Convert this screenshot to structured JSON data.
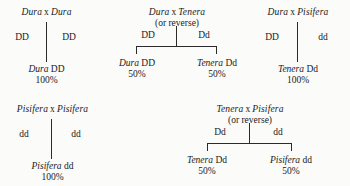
{
  "figure": {
    "type": "genetics-cross-diagram",
    "background_color": "#fbfbfa",
    "line_color": "#2b2b2b",
    "text_color": "#1a1a1a"
  },
  "crosses": [
    {
      "id": "dura-x-dura",
      "title_left": "Dura",
      "title_symbol": "x",
      "title_right": "Dura",
      "subtitle": "",
      "parent_left": "DD",
      "parent_right": "DD",
      "connector": "single",
      "offspring": [
        {
          "name": "Dura",
          "genotype": "DD",
          "percent": "100%"
        }
      ]
    },
    {
      "id": "dura-x-tenera",
      "title_left": "Dura",
      "title_symbol": "x",
      "title_right": "Tenera",
      "subtitle": "(or reverse)",
      "parent_left": "DD",
      "parent_right": "Dd",
      "connector": "fork",
      "offspring": [
        {
          "name": "Dura",
          "genotype": "DD",
          "percent": "50%"
        },
        {
          "name": "Tenera",
          "genotype": "Dd",
          "percent": "50%"
        }
      ]
    },
    {
      "id": "dura-x-pisifera",
      "title_left": "Dura",
      "title_symbol": "x",
      "title_right": "Pisifera",
      "subtitle": "",
      "parent_left": "DD",
      "parent_right": "dd",
      "connector": "single",
      "offspring": [
        {
          "name": "Tenera",
          "genotype": "Dd",
          "percent": "100%"
        }
      ]
    },
    {
      "id": "pisifera-x-pisifera",
      "title_left": "Pisifera",
      "title_symbol": "x",
      "title_right": "Pisifera",
      "subtitle": "",
      "parent_left": "dd",
      "parent_right": "dd",
      "connector": "single",
      "offspring": [
        {
          "name": "Pisifera",
          "genotype": "dd",
          "percent": "100%"
        }
      ]
    },
    {
      "id": "tenera-x-pisifera",
      "title_left": "Tenera",
      "title_symbol": "x",
      "title_right": "Pisifera",
      "subtitle": "(or reverse)",
      "parent_left": "Dd",
      "parent_right": "dd",
      "connector": "fork",
      "offspring": [
        {
          "name": "Tenera",
          "genotype": "Dd",
          "percent": "50%"
        },
        {
          "name": "Pisifera",
          "genotype": "dd",
          "percent": "50%"
        }
      ]
    }
  ]
}
